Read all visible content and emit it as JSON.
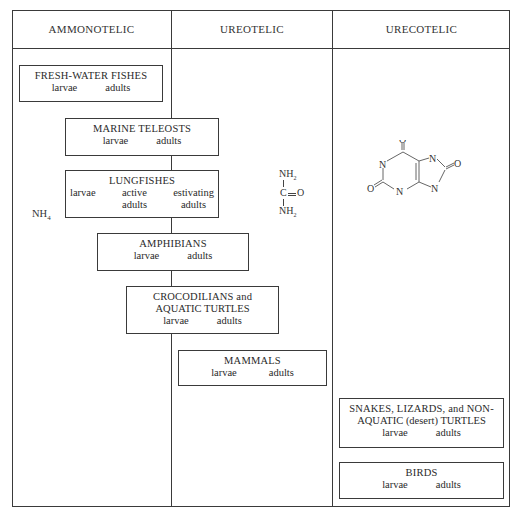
{
  "headers": [
    "AMMONOTELIC",
    "UREOTELIC",
    "URECOTELIC"
  ],
  "ammonia_label": {
    "text": "NH",
    "sub": "4"
  },
  "urea": {
    "top": "NH",
    "top_sub": "2",
    "center": "C",
    "oxygen": "O",
    "bottom": "NH",
    "bottom_sub": "2"
  },
  "uric_acid": {
    "atoms": [
      "O",
      "N",
      "O",
      "N",
      "N",
      "O",
      "N"
    ]
  },
  "boxes": [
    {
      "title": "FRESH-WATER FISHES",
      "title2": "",
      "stages": [
        "larvae",
        "adults"
      ],
      "stages2": []
    },
    {
      "title": "MARINE TELEOSTS",
      "title2": "",
      "stages": [
        "larvae",
        "adults"
      ],
      "stages2": []
    },
    {
      "title": "LUNGFISHES",
      "title2": "",
      "stages": [
        "larvae",
        "active",
        "estivating"
      ],
      "stages2": [
        "",
        "adults",
        "adults"
      ]
    },
    {
      "title": "AMPHIBIANS",
      "title2": "",
      "stages": [
        "larvae",
        "adults"
      ],
      "stages2": []
    },
    {
      "title": "CROCODILIANS and",
      "title2": "AQUATIC TURTLES",
      "stages": [
        "larvae",
        "adults"
      ],
      "stages2": []
    },
    {
      "title": "MAMMALS",
      "title2": "",
      "stages": [
        "larvae",
        "adults"
      ],
      "stages2": []
    },
    {
      "title": "SNAKES, LIZARDS, and NON-",
      "title2": "AQUATIC (desert) TURTLES",
      "stages": [
        "larvae",
        "adults"
      ],
      "stages2": []
    },
    {
      "title": "BIRDS",
      "title2": "",
      "stages": [
        "larvae",
        "adults"
      ],
      "stages2": []
    }
  ]
}
